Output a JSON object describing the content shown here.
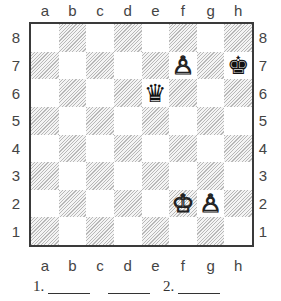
{
  "board": {
    "files": [
      "a",
      "b",
      "c",
      "d",
      "e",
      "f",
      "g",
      "h"
    ],
    "ranks": [
      "8",
      "7",
      "6",
      "5",
      "4",
      "3",
      "2",
      "1"
    ],
    "colors": {
      "light": "#ffffff",
      "dark_hatch": "#b8b8b8",
      "border": "#3a3a3a"
    },
    "pieces": [
      {
        "square": "f7",
        "color": "white",
        "type": "pawn",
        "glyph": "♙"
      },
      {
        "square": "h7",
        "color": "black",
        "type": "king",
        "glyph": "♚"
      },
      {
        "square": "e6",
        "color": "black",
        "type": "queen",
        "glyph": "♛"
      },
      {
        "square": "f2",
        "color": "white",
        "type": "king",
        "glyph": "♔"
      },
      {
        "square": "g2",
        "color": "white",
        "type": "pawn",
        "glyph": "♙"
      }
    ]
  },
  "answers": {
    "move1_label": "1.",
    "move2_label": "2."
  }
}
